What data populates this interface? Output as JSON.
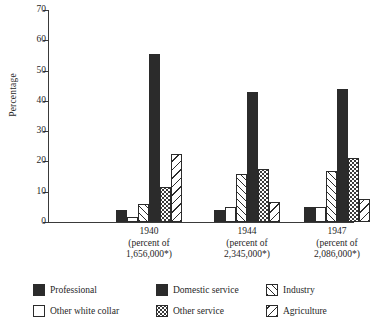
{
  "chart_data": {
    "type": "bar",
    "title": "",
    "subtitle": "",
    "xlabel": "",
    "ylabel": "Percentage",
    "ylim": [
      0,
      70
    ],
    "yticks": [
      0,
      10,
      20,
      30,
      40,
      50,
      60,
      70
    ],
    "ytick_labels": [
      "0",
      "10",
      "20",
      "30",
      "40",
      "50",
      "60",
      "70"
    ],
    "grid": false,
    "legend_position": "bottom",
    "categories": [
      "1940",
      "1944",
      "1947"
    ],
    "category_sublabels": [
      [
        "(percent of",
        "1,656,000*)"
      ],
      [
        "(percent of",
        "2,345,000*)"
      ],
      [
        "(percent of",
        "2,086,000*)"
      ]
    ],
    "series": [
      {
        "name": "Professional",
        "pattern": "solid-black",
        "values": [
          4.0,
          4.0,
          5.0
        ]
      },
      {
        "name": "Other white collar",
        "pattern": "white",
        "values": [
          1.5,
          5.0,
          5.0
        ]
      },
      {
        "name": "Industry",
        "pattern": "diagonal-up",
        "values": [
          6.0,
          16.0,
          17.0
        ]
      },
      {
        "name": "Domestic service",
        "pattern": "solid-black",
        "values": [
          55.5,
          43.0,
          44.0
        ]
      },
      {
        "name": "Other service",
        "pattern": "dotted",
        "values": [
          11.5,
          17.5,
          21.0
        ]
      },
      {
        "name": "Agriculture",
        "pattern": "diagonal-down",
        "values": [
          22.5,
          6.5,
          7.5
        ]
      }
    ]
  },
  "legend": {
    "items": [
      {
        "label": "Professional",
        "swatch": "swatch-professional-icon"
      },
      {
        "label": "Domestic service",
        "swatch": "swatch-domestic-service-icon"
      },
      {
        "label": "Industry",
        "swatch": "swatch-industry-icon"
      },
      {
        "label": "Other white collar",
        "swatch": "swatch-other-white-collar-icon"
      },
      {
        "label": "Other service",
        "swatch": "swatch-other-service-icon"
      },
      {
        "label": "Agriculture",
        "swatch": "swatch-agriculture-icon"
      }
    ]
  },
  "colors": {
    "ink": "#2b2b2b",
    "background": "#ffffff",
    "axis": "#3a3a3a"
  }
}
